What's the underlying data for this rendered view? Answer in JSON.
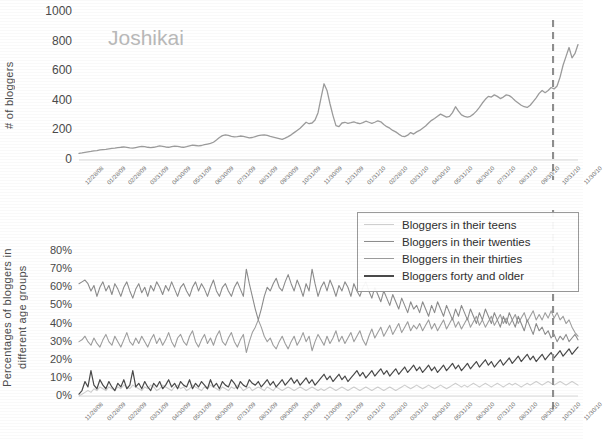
{
  "figure": {
    "background": "#ffffff"
  },
  "colors": {
    "teens": "#cfcfcf",
    "twenties": "#8c8c8c",
    "thirties": "#9e9e9e",
    "forty_plus": "#4a4a4a",
    "top_line": "#9c9c9c",
    "dashed_marker": "#8f8f8f",
    "title_text": "#b9b9b9",
    "tick_text": "#6e6e6e"
  },
  "top_panel": {
    "title": "Joshikai",
    "ylabel": "# of bloggers",
    "yticks": [
      "1000",
      "800",
      "600",
      "400",
      "200",
      "0"
    ],
    "xticks": [
      "12/28/08",
      "01/28/09",
      "02/28/09",
      "03/31/09",
      "04/30/09",
      "05/31/09",
      "06/30/09",
      "07/31/09",
      "08/31/09",
      "09/30/09",
      "10/31/09",
      "11/30/09",
      "12/31/09",
      "01/31/10",
      "02/28/10",
      "03/31/10",
      "04/30/10",
      "05/31/10",
      "06/30/10",
      "07/31/10",
      "08/31/10",
      "09/30/10",
      "10/31/10",
      "11/30/10"
    ]
  },
  "bottom_panel": {
    "ylabel": "Percentages of bloggers in different age groups",
    "yticks": [
      "80%",
      "70%",
      "60%",
      "50%",
      "40%",
      "30%",
      "20%",
      "10%",
      "0%"
    ],
    "xticks": [
      "11/28/08",
      "01/28/09",
      "02/28/09",
      "03/31/09",
      "04/30/09",
      "05/31/09",
      "06/30/09",
      "07/31/09",
      "08/31/09",
      "09/30/09",
      "10/31/09",
      "11/30/09",
      "12/31/09",
      "01/31/10",
      "02/28/10",
      "03/31/10",
      "04/30/10",
      "05/31/10",
      "06/30/10",
      "07/31/10",
      "08/31/10",
      "09/30/10",
      "10/31/10",
      "11/30/10"
    ],
    "legend": [
      {
        "label": "Bloggers in their teens",
        "color": "#cfcfcf"
      },
      {
        "label": "Bloggers in their twenties",
        "color": "#8c8c8c"
      },
      {
        "label": "Bloggers in their thirties",
        "color": "#9e9e9e"
      },
      {
        "label": "Bloggers forty and older",
        "color": "#4a4a4a"
      }
    ]
  },
  "chart_data": [
    {
      "type": "line",
      "title": "Joshikai",
      "xlabel": "",
      "ylabel": "# of bloggers",
      "ylim": [
        0,
        1000
      ],
      "yticks": [
        0,
        200,
        400,
        600,
        800,
        1000
      ],
      "grid": false,
      "legend_position": "none",
      "annotations": [
        {
          "type": "vline",
          "x_index": 95,
          "style": "dashed",
          "color": "#8f8f8f"
        }
      ],
      "x": [
        "12/28/08",
        "01/28/09",
        "02/28/09",
        "03/31/09",
        "04/30/09",
        "05/31/09",
        "06/30/09",
        "07/31/09",
        "08/31/09",
        "09/30/09",
        "10/31/09",
        "11/30/09",
        "12/31/09",
        "01/31/10",
        "02/28/10",
        "03/31/10",
        "04/30/10",
        "05/31/10",
        "06/30/10",
        "07/31/10",
        "08/31/10",
        "09/30/10",
        "10/31/10",
        "11/30/10"
      ],
      "series": [
        {
          "name": "# of bloggers",
          "color": "#9c9c9c",
          "values": [
            45,
            48,
            52,
            55,
            58,
            62,
            64,
            68,
            70,
            72,
            75,
            78,
            80,
            83,
            86,
            88,
            85,
            82,
            80,
            84,
            88,
            92,
            90,
            86,
            84,
            86,
            90,
            95,
            92,
            88,
            86,
            90,
            94,
            92,
            88,
            86,
            90,
            96,
            100,
            98,
            95,
            98,
            104,
            108,
            112,
            120,
            135,
            152,
            165,
            170,
            166,
            160,
            156,
            158,
            162,
            160,
            155,
            150,
            152,
            158,
            164,
            168,
            170,
            166,
            160,
            155,
            150,
            145,
            140,
            148,
            158,
            170,
            185,
            200,
            215,
            235,
            255,
            245,
            250,
            270,
            320,
            420,
            515,
            470,
            380,
            300,
            232,
            225,
            250,
            255,
            248,
            252,
            258,
            250,
            245,
            252,
            262,
            255,
            248,
            255,
            265,
            258,
            240,
            225,
            215,
            200,
            190,
            175,
            162,
            158,
            168,
            185,
            175,
            190,
            200,
            215,
            230,
            250,
            268,
            280,
            295,
            310,
            300,
            290,
            295,
            320,
            360,
            330,
            305,
            295,
            290,
            295,
            310,
            330,
            355,
            385,
            410,
            430,
            425,
            440,
            430,
            415,
            425,
            440,
            435,
            420,
            400,
            385,
            370,
            360,
            355,
            370,
            395,
            420,
            450,
            470,
            455,
            470,
            490,
            480,
            500,
            560,
            640,
            700,
            760,
            690,
            720,
            780
          ]
        }
      ]
    },
    {
      "type": "line",
      "title": "",
      "xlabel": "",
      "ylabel": "Percentages of bloggers in different age groups",
      "ylim": [
        0,
        85
      ],
      "yticks": [
        0,
        10,
        20,
        30,
        40,
        50,
        60,
        70,
        80
      ],
      "y_tick_format": "percent",
      "grid": false,
      "legend_position": "upper-right",
      "annotations": [
        {
          "type": "vline",
          "x_index": 95,
          "style": "dashed",
          "color": "#8f8f8f"
        }
      ],
      "x": [
        "11/28/08",
        "01/28/09",
        "02/28/09",
        "03/31/09",
        "04/30/09",
        "05/31/09",
        "06/30/09",
        "07/31/09",
        "08/31/09",
        "09/30/09",
        "10/31/09",
        "11/30/09",
        "12/31/09",
        "01/31/10",
        "02/28/10",
        "03/31/10",
        "04/30/10",
        "05/31/10",
        "06/30/10",
        "07/31/10",
        "08/31/10",
        "09/30/10",
        "10/31/10",
        "11/30/10"
      ],
      "series": [
        {
          "name": "Bloggers in their teens",
          "color": "#cfcfcf",
          "values": [
            0,
            1,
            2,
            3,
            2,
            4,
            3,
            5,
            4,
            3,
            5,
            4,
            3,
            5,
            4,
            6,
            5,
            4,
            6,
            5,
            4,
            3,
            5,
            4,
            6,
            5,
            3,
            4,
            6,
            5,
            4,
            3,
            5,
            6,
            4,
            5,
            3,
            4,
            6,
            5,
            4,
            3,
            5,
            4,
            6,
            5,
            4,
            3,
            5,
            4,
            3,
            5,
            4,
            6,
            5,
            3,
            4,
            5,
            3,
            4,
            5,
            4,
            3,
            5,
            4,
            3,
            5,
            4,
            3,
            4,
            5,
            4,
            3,
            4,
            5,
            4,
            3,
            4,
            5,
            4,
            3,
            4,
            3,
            4,
            5,
            4,
            3,
            4,
            5,
            4,
            3,
            4,
            5,
            4,
            3,
            4,
            5,
            4,
            3,
            4,
            5,
            4,
            3,
            4,
            5,
            4,
            3,
            4,
            5,
            6,
            5,
            4,
            5,
            6,
            5,
            4,
            5,
            6,
            5,
            4,
            5,
            6,
            5,
            4,
            5,
            6,
            7,
            6,
            5,
            6,
            5,
            6,
            7,
            6,
            5,
            6,
            7,
            6,
            5,
            6,
            7,
            6,
            5,
            6,
            7,
            6,
            7,
            6,
            5,
            6,
            7,
            6,
            7,
            8,
            7,
            6,
            7,
            8,
            7,
            6,
            7,
            8,
            7,
            6,
            7,
            8,
            7,
            6
          ]
        },
        {
          "name": "Bloggers in their twenties",
          "color": "#8c8c8c",
          "values": [
            62,
            63,
            64,
            62,
            58,
            61,
            55,
            60,
            63,
            58,
            61,
            56,
            62,
            59,
            55,
            60,
            63,
            58,
            54,
            59,
            62,
            57,
            60,
            55,
            61,
            58,
            63,
            60,
            56,
            61,
            58,
            63,
            59,
            55,
            60,
            62,
            58,
            55,
            60,
            63,
            58,
            62,
            59,
            55,
            60,
            64,
            58,
            55,
            60,
            62,
            58,
            55,
            60,
            63,
            59,
            55,
            70,
            62,
            55,
            48,
            42,
            48,
            55,
            60,
            58,
            62,
            65,
            60,
            58,
            63,
            67,
            62,
            58,
            64,
            60,
            55,
            62,
            58,
            70,
            62,
            55,
            60,
            63,
            58,
            64,
            60,
            55,
            61,
            58,
            63,
            60,
            55,
            62,
            58,
            55,
            60,
            63,
            58,
            54,
            60,
            56,
            52,
            58,
            54,
            50,
            56,
            52,
            48,
            54,
            50,
            46,
            52,
            48,
            50,
            46,
            52,
            48,
            44,
            50,
            46,
            52,
            48,
            44,
            50,
            46,
            42,
            48,
            44,
            50,
            46,
            42,
            48,
            44,
            40,
            46,
            42,
            48,
            44,
            40,
            46,
            42,
            38,
            44,
            40,
            46,
            42,
            38,
            44,
            40,
            36,
            42,
            38,
            34,
            40,
            36,
            38,
            34,
            36,
            32,
            34,
            30,
            33,
            31,
            34,
            30,
            32,
            34,
            31
          ]
        },
        {
          "name": "Bloggers in their thirties",
          "color": "#9e9e9e",
          "values": [
            30,
            31,
            33,
            30,
            28,
            32,
            29,
            27,
            31,
            34,
            30,
            28,
            33,
            30,
            27,
            31,
            35,
            30,
            28,
            32,
            29,
            33,
            30,
            27,
            31,
            34,
            29,
            32,
            28,
            31,
            35,
            30,
            27,
            32,
            34,
            30,
            28,
            33,
            36,
            30,
            27,
            31,
            34,
            29,
            32,
            28,
            33,
            36,
            30,
            28,
            32,
            35,
            30,
            27,
            31,
            34,
            24,
            30,
            35,
            38,
            42,
            38,
            33,
            30,
            32,
            28,
            26,
            30,
            33,
            29,
            26,
            30,
            33,
            28,
            31,
            35,
            30,
            33,
            25,
            30,
            34,
            31,
            28,
            33,
            29,
            32,
            36,
            30,
            33,
            29,
            32,
            35,
            30,
            33,
            36,
            31,
            28,
            33,
            37,
            32,
            35,
            38,
            33,
            36,
            39,
            34,
            37,
            40,
            35,
            38,
            41,
            36,
            39,
            37,
            40,
            36,
            39,
            42,
            37,
            40,
            36,
            39,
            42,
            37,
            40,
            43,
            38,
            41,
            37,
            40,
            43,
            38,
            41,
            44,
            39,
            42,
            38,
            41,
            44,
            39,
            42,
            45,
            40,
            43,
            39,
            42,
            45,
            40,
            43,
            46,
            41,
            44,
            47,
            42,
            45,
            42,
            46,
            43,
            47,
            43,
            46,
            42,
            44,
            40,
            42,
            38,
            35,
            33
          ]
        },
        {
          "name": "Bloggers forty and older",
          "color": "#4a4a4a",
          "values": [
            1,
            3,
            8,
            5,
            14,
            6,
            4,
            9,
            6,
            4,
            8,
            5,
            3,
            7,
            5,
            9,
            4,
            6,
            14,
            5,
            7,
            4,
            8,
            5,
            3,
            7,
            5,
            8,
            4,
            6,
            9,
            5,
            7,
            4,
            8,
            6,
            5,
            9,
            4,
            7,
            5,
            8,
            6,
            4,
            9,
            5,
            7,
            4,
            8,
            6,
            5,
            9,
            7,
            4,
            8,
            6,
            5,
            9,
            7,
            6,
            8,
            5,
            7,
            9,
            6,
            8,
            5,
            7,
            9,
            6,
            8,
            10,
            7,
            9,
            6,
            8,
            10,
            7,
            9,
            6,
            8,
            10,
            12,
            9,
            11,
            8,
            10,
            12,
            9,
            11,
            8,
            10,
            12,
            14,
            11,
            13,
            10,
            12,
            14,
            11,
            13,
            15,
            12,
            14,
            11,
            13,
            15,
            12,
            14,
            16,
            13,
            15,
            17,
            14,
            16,
            13,
            15,
            17,
            14,
            16,
            13,
            15,
            17,
            14,
            16,
            18,
            15,
            17,
            14,
            16,
            18,
            15,
            17,
            19,
            16,
            18,
            20,
            17,
            19,
            16,
            18,
            20,
            17,
            19,
            21,
            18,
            20,
            22,
            19,
            21,
            23,
            20,
            22,
            19,
            21,
            23,
            20,
            22,
            24,
            21,
            23,
            25,
            22,
            24,
            26,
            23,
            25,
            27
          ]
        }
      ]
    }
  ]
}
